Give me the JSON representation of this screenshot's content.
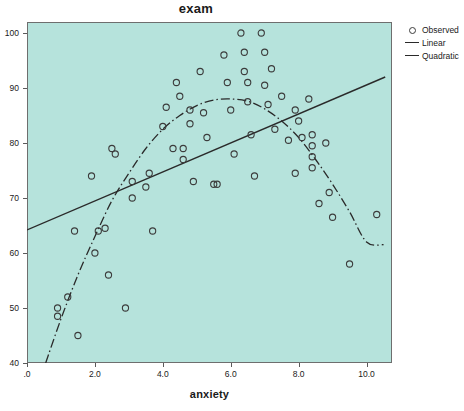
{
  "chart_data": {
    "type": "scatter",
    "title": "exam",
    "xlabel": "anxiety",
    "ylabel": "",
    "xlim": [
      0,
      10.75
    ],
    "ylim": [
      40,
      102
    ],
    "grid": false,
    "legend_position": "right-outside",
    "background_color": "#b6e3dc",
    "marker_color": "#3c3c3c",
    "line_color": "#2a2a2a",
    "xticks": [
      ".0",
      "2.0",
      "4.0",
      "6.0",
      "8.0",
      "10.0"
    ],
    "xtick_values": [
      0,
      2,
      4,
      6,
      8,
      10
    ],
    "yticks": [
      "40",
      "50",
      "60",
      "70",
      "80",
      "90",
      "100"
    ],
    "ytick_values": [
      40,
      50,
      60,
      70,
      80,
      90,
      100
    ],
    "legend": [
      {
        "label": "Observed",
        "glyph": "circle-marker"
      },
      {
        "label": "Linear",
        "glyph": "line-segment"
      },
      {
        "label": "Quadratic",
        "glyph": "line-segment"
      }
    ],
    "series": [
      {
        "name": "Observed",
        "type": "scatter",
        "points": [
          [
            0.9,
            50.0
          ],
          [
            0.9,
            48.5
          ],
          [
            1.2,
            52.0
          ],
          [
            1.4,
            64.0
          ],
          [
            1.5,
            45.0
          ],
          [
            1.9,
            74.0
          ],
          [
            2.0,
            60.0
          ],
          [
            2.1,
            64.0
          ],
          [
            2.3,
            64.5
          ],
          [
            2.4,
            56.0
          ],
          [
            2.5,
            79.0
          ],
          [
            2.6,
            78.0
          ],
          [
            2.9,
            50.0
          ],
          [
            3.1,
            70.0
          ],
          [
            3.1,
            73.0
          ],
          [
            3.5,
            72.0
          ],
          [
            3.6,
            74.5
          ],
          [
            3.7,
            64.0
          ],
          [
            4.0,
            83.0
          ],
          [
            4.1,
            86.5
          ],
          [
            4.3,
            79.0
          ],
          [
            4.4,
            91.0
          ],
          [
            4.5,
            88.5
          ],
          [
            4.6,
            77.0
          ],
          [
            4.6,
            79.0
          ],
          [
            4.8,
            83.5
          ],
          [
            4.8,
            86.0
          ],
          [
            4.9,
            73.0
          ],
          [
            5.1,
            93.0
          ],
          [
            5.2,
            85.5
          ],
          [
            5.3,
            81.0
          ],
          [
            5.5,
            72.5
          ],
          [
            5.6,
            72.5
          ],
          [
            5.8,
            96.0
          ],
          [
            5.9,
            91.0
          ],
          [
            6.0,
            86.0
          ],
          [
            6.1,
            78.0
          ],
          [
            6.3,
            100.0
          ],
          [
            6.4,
            96.5
          ],
          [
            6.4,
            93.0
          ],
          [
            6.5,
            91.0
          ],
          [
            6.5,
            87.5
          ],
          [
            6.6,
            81.5
          ],
          [
            6.7,
            74.0
          ],
          [
            6.9,
            100.0
          ],
          [
            7.0,
            96.5
          ],
          [
            7.0,
            90.5
          ],
          [
            7.1,
            87.0
          ],
          [
            7.2,
            93.5
          ],
          [
            7.3,
            82.5
          ],
          [
            7.5,
            88.5
          ],
          [
            7.7,
            80.5
          ],
          [
            7.9,
            86.0
          ],
          [
            7.9,
            74.5
          ],
          [
            8.0,
            84.0
          ],
          [
            8.1,
            81.0
          ],
          [
            8.3,
            88.0
          ],
          [
            8.4,
            81.5
          ],
          [
            8.4,
            79.5
          ],
          [
            8.4,
            77.5
          ],
          [
            8.4,
            75.5
          ],
          [
            8.6,
            69.0
          ],
          [
            8.8,
            80.0
          ],
          [
            8.9,
            71.0
          ],
          [
            9.0,
            66.5
          ],
          [
            9.5,
            58.0
          ],
          [
            10.3,
            67.0
          ]
        ]
      },
      {
        "name": "Linear",
        "type": "line",
        "points": [
          [
            0.0,
            64.2
          ],
          [
            10.55,
            92.0
          ]
        ]
      },
      {
        "name": "Quadratic",
        "type": "line",
        "points": [
          [
            0.55,
            40.0
          ],
          [
            1.0,
            48.0
          ],
          [
            1.5,
            56.0
          ],
          [
            2.0,
            63.0
          ],
          [
            2.5,
            69.5
          ],
          [
            3.0,
            74.5
          ],
          [
            3.5,
            79.0
          ],
          [
            4.0,
            82.5
          ],
          [
            4.5,
            85.0
          ],
          [
            5.0,
            86.8
          ],
          [
            5.5,
            87.8
          ],
          [
            6.0,
            88.0
          ],
          [
            6.5,
            87.6
          ],
          [
            7.0,
            86.2
          ],
          [
            7.5,
            84.0
          ],
          [
            8.0,
            81.0
          ],
          [
            8.5,
            77.0
          ],
          [
            9.0,
            72.5
          ],
          [
            9.5,
            67.5
          ],
          [
            10.0,
            62.0
          ],
          [
            10.5,
            61.5
          ]
        ]
      }
    ]
  }
}
